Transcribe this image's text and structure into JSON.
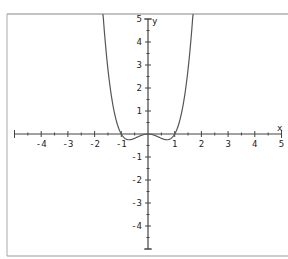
{
  "chart_data": {
    "type": "line",
    "title": "",
    "function": "y = x^4 - x^2",
    "xlabel": "x",
    "ylabel": "y",
    "xlim": [
      -5,
      5
    ],
    "ylim": [
      -5,
      5
    ],
    "grid": false,
    "x_ticks": [
      -4,
      -3,
      -2,
      -1,
      1,
      2,
      3,
      4,
      5
    ],
    "y_ticks": [
      -4,
      -3,
      -2,
      -1,
      1,
      2,
      3,
      4,
      5
    ],
    "x_tick_labels": [
      "-4",
      "-3",
      "-2",
      "-1",
      "1",
      "2",
      "3",
      "4",
      "5"
    ],
    "y_tick_labels": [
      "-4",
      "-3",
      "-2",
      "-1",
      "1",
      "2",
      "3",
      "4",
      "5"
    ],
    "series": [
      {
        "name": "f(x)",
        "x": [
          -1.67,
          -1.5,
          -1.25,
          -1.0,
          -0.85,
          -0.707,
          -0.5,
          -0.25,
          0,
          0.25,
          0.5,
          0.707,
          0.85,
          1.0,
          1.25,
          1.5,
          1.67
        ],
        "y": [
          5.0,
          2.81,
          0.88,
          0,
          -0.2,
          -0.25,
          -0.19,
          -0.06,
          0,
          -0.06,
          -0.19,
          -0.25,
          -0.2,
          0,
          0.88,
          2.81,
          5.0
        ]
      }
    ],
    "colors": {
      "curve": "#555555",
      "axes": "#444444",
      "frame": "#888888"
    }
  }
}
